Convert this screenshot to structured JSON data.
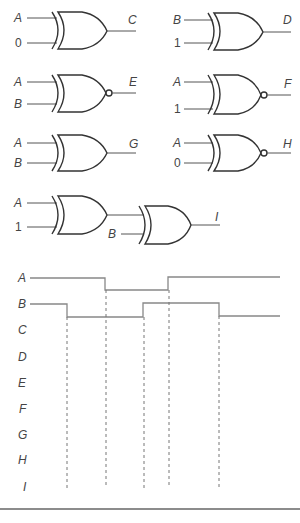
{
  "gates": [
    {
      "id": "C",
      "type": "XOR",
      "inputs": [
        "A",
        "0"
      ],
      "output": "C"
    },
    {
      "id": "D",
      "type": "XOR",
      "inputs": [
        "B",
        "1"
      ],
      "output": "D"
    },
    {
      "id": "E",
      "type": "XNOR",
      "inputs": [
        "A",
        "B"
      ],
      "output": "E"
    },
    {
      "id": "F",
      "type": "XNOR",
      "inputs": [
        "A",
        "1"
      ],
      "output": "F"
    },
    {
      "id": "G",
      "type": "XOR",
      "inputs": [
        "A",
        "B"
      ],
      "output": "G"
    },
    {
      "id": "H",
      "type": "XNOR",
      "inputs": [
        "A",
        "0"
      ],
      "output": "H"
    },
    {
      "id": "I",
      "type": "XOR-XOR chain",
      "inputs": [
        "A",
        "1",
        "B"
      ],
      "output": "I"
    }
  ],
  "timing": {
    "signals": [
      "A",
      "B",
      "C",
      "D",
      "E",
      "F",
      "G",
      "H",
      "I"
    ],
    "transitions_x": [
      67,
      105,
      143,
      168,
      219
    ],
    "A_waveform": [
      1,
      1,
      0,
      0,
      1,
      1
    ],
    "B_waveform": [
      1,
      0,
      0,
      1,
      1,
      0
    ]
  }
}
